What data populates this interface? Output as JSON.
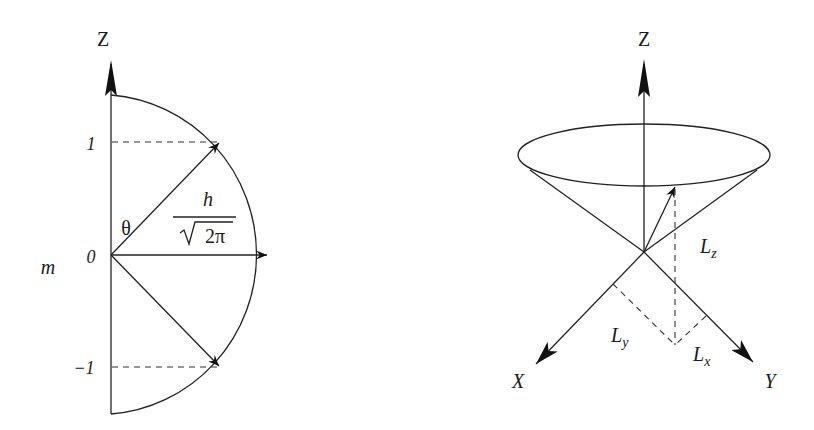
{
  "left_diagram": {
    "title": "Space quantization of angular momentum (l = 1)",
    "axis_label": "Z",
    "quantum_number_label": "m",
    "levels": [
      "1",
      "0",
      "−1"
    ],
    "angle_label": "θ",
    "magnitude": {
      "numerator": "h",
      "denominator_radical": "√",
      "denominator_value": "2π"
    }
  },
  "right_diagram": {
    "title": "Precession cone of angular momentum vector",
    "axis_z": "Z",
    "axis_x": "X",
    "axis_y": "Y",
    "component_z": {
      "base": "L",
      "sub": "z"
    },
    "component_x": {
      "base": "L",
      "sub": "x"
    },
    "component_y": {
      "base": "L",
      "sub": "y"
    }
  },
  "colors": {
    "background": "#ffffff",
    "ink": "#1a1a1a"
  }
}
